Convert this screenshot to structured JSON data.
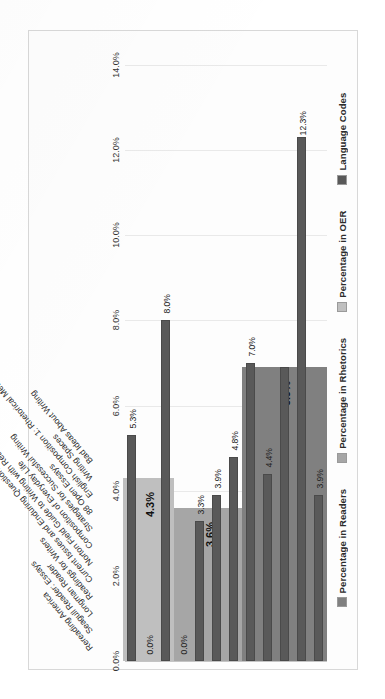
{
  "chart_data": {
    "type": "bar",
    "title": "",
    "subtitle": "",
    "xlabel": "",
    "ylabel": "",
    "orientation": "vertical-rotated-90",
    "grid": true,
    "legend_position": "top",
    "ylim": [
      0,
      14
    ],
    "tick_labels": [
      "0.0%",
      "2.0%",
      "4.0%",
      "6.0%",
      "8.0%",
      "10.0%",
      "12.0%",
      "14.0%"
    ],
    "tick_values": [
      0,
      2,
      4,
      6,
      8,
      10,
      12,
      14
    ],
    "legend": [
      {
        "label": "Percentage in Readers",
        "color": "#808080"
      },
      {
        "label": "Percentage in Rhetorics",
        "color": "#a6a6a6"
      },
      {
        "label": "Percentage in OER",
        "color": "#bfbfbf"
      },
      {
        "label": "Language Codes",
        "color": "#595959"
      }
    ],
    "categories": [
      "Rereading America",
      "Seagull Reader: Essays",
      "Longman Reader",
      "Readings for Writers",
      "Current Issues and Enduring Questions",
      "Norton Field Guide to Writing with Readings",
      "Composition of Everyday Life",
      "Strategies for Successful Writing",
      "88 Open Essays",
      "English Composition 1: Rhetorical Methods-...",
      "Writing Spaces",
      "Bad Ideas About Writing"
    ],
    "series": [
      {
        "name": "Language Codes",
        "color": "#595959",
        "values": [
          3.9,
          12.3,
          6.9,
          4.4,
          7.0,
          4.8,
          3.9,
          3.3,
          0.0,
          8.0,
          5.3,
          0.0
        ],
        "labels": [
          "3.9%",
          "12.3%",
          "6.9%",
          "4.4%",
          "7.0%",
          "4.8%",
          "3.9%",
          "3.3%",
          "0.0%",
          "8.0%",
          "0.0%",
          "5.3%",
          "0.0%"
        ]
      }
    ],
    "bar_labels": [
      "3.9%",
      "12.3%",
      "",
      "4.4%",
      "7.0%",
      "4.8%",
      "3.9%",
      "3.3%",
      "0.0%",
      "8.0%",
      "0.0%",
      "5.3%",
      "0.0%"
    ],
    "groups": [
      {
        "name": "Percentage in Readers",
        "color": "#808080",
        "value": 6.9,
        "value_label": "6.9%",
        "category_start": 0,
        "category_end": 4,
        "bars": [
          {
            "category": "Rereading America",
            "value": 3.9,
            "label": "3.9%"
          },
          {
            "category": "Seagull Reader: Essays",
            "value": 12.3,
            "label": "12.3%"
          },
          {
            "category": "Longman Reader",
            "value": 6.9,
            "label": ""
          },
          {
            "category": "Readings for Writers",
            "value": 4.4,
            "label": "4.4%"
          },
          {
            "category": "Current Issues and Enduring Questions",
            "value": 7.0,
            "label": "7.0%"
          }
        ]
      },
      {
        "name": "Percentage in Rhetorics",
        "color": "#a6a6a6",
        "value": 3.6,
        "value_label": "3.6%",
        "category_start": 5,
        "category_end": 8,
        "bars": [
          {
            "category": "Norton Field Guide to Writing with Readings",
            "value": 4.8,
            "label": "4.8%"
          },
          {
            "category": "Composition of Everyday Life",
            "value": 3.9,
            "label": "3.9%"
          },
          {
            "category": "Strategies for Successful Writing",
            "value": 3.3,
            "label": "3.3%"
          },
          {
            "category": "88 Open Essays",
            "value": 0.0,
            "label": "0.0%"
          }
        ]
      },
      {
        "name": "Percentage in OER",
        "color": "#bfbfbf",
        "value": 4.3,
        "value_label": "4.3%",
        "category_start": 9,
        "category_end": 11,
        "bars": [
          {
            "category": "English Composition 1: Rhetorical Methods-...",
            "value": 8.0,
            "label": "8.0%"
          },
          {
            "category": "Writing Spaces",
            "value": 0.0,
            "label": "0.0%"
          },
          {
            "category": "Bad Ideas About Writing",
            "value": 5.3,
            "label": "5.3%"
          },
          {
            "category": "__end",
            "value": 0.0,
            "label": "0.0%"
          }
        ]
      }
    ]
  }
}
